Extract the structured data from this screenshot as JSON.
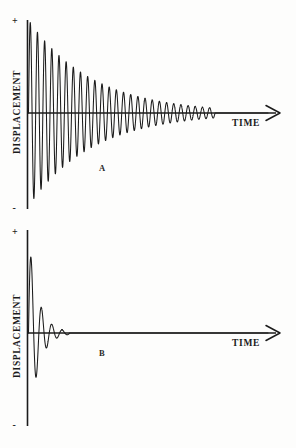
{
  "figure": {
    "title": "",
    "background_color": "#fdfdfc",
    "line_color": "#1b1b1b"
  },
  "panels": [
    {
      "id": "A",
      "letter_label": "A",
      "y_axis_label": "DISPLACEMENT",
      "x_axis_label": "TIME",
      "positive_sign": "+",
      "negative_sign": "-",
      "x_axis_arrow": "arrow-right-icon"
    },
    {
      "id": "B",
      "letter_label": "B",
      "y_axis_label": "DISPLACEMENT",
      "x_axis_label": "TIME",
      "positive_sign": "+",
      "negative_sign": "-",
      "x_axis_arrow": "arrow-right-icon"
    }
  ],
  "chart_data": [
    {
      "type": "line",
      "title": "A",
      "xlabel": "TIME",
      "ylabel": "DISPLACEMENT",
      "description": "Lightly damped free vibration: sinusoidal oscillation whose amplitude decays exponentially over many cycles.",
      "xlim": [
        0,
        1
      ],
      "ylim": [
        -1,
        1
      ],
      "grid": false,
      "legend": false,
      "yticks": [
        "+",
        "-"
      ],
      "series": [
        {
          "name": "displacement-a",
          "model": "damped-sine",
          "amplitude": 1.0,
          "damping_ratio": 0.0175,
          "cycles": 26,
          "decay_constant_per_cycle": 0.893,
          "x": [
            0.0,
            0.02,
            0.04,
            0.06,
            0.08,
            0.1,
            0.12,
            0.14,
            0.16,
            0.18,
            0.2,
            0.24,
            0.28,
            0.32,
            0.36,
            0.4,
            0.45,
            0.5,
            0.55,
            0.6,
            0.65,
            0.7,
            0.75,
            0.8,
            0.85,
            0.9,
            1.0
          ],
          "envelope": [
            1.0,
            0.93,
            0.86,
            0.8,
            0.74,
            0.69,
            0.64,
            0.59,
            0.55,
            0.51,
            0.47,
            0.41,
            0.35,
            0.3,
            0.26,
            0.22,
            0.18,
            0.14,
            0.11,
            0.09,
            0.07,
            0.05,
            0.04,
            0.03,
            0.02,
            0.015,
            0.0
          ]
        }
      ]
    },
    {
      "type": "line",
      "title": "B",
      "xlabel": "TIME",
      "ylabel": "DISPLACEMENT",
      "description": "Heavily damped free vibration: oscillation amplitude decays to zero within about three to four cycles.",
      "xlim": [
        0,
        1
      ],
      "ylim": [
        -1,
        1
      ],
      "grid": false,
      "legend": false,
      "yticks": [
        "+",
        "-"
      ],
      "series": [
        {
          "name": "displacement-b",
          "model": "damped-sine",
          "amplitude": 1.0,
          "damping_ratio": 0.17,
          "cycles": 4,
          "decay_constant_per_cycle": 0.34,
          "x": [
            0.0,
            0.01,
            0.02,
            0.03,
            0.04,
            0.05,
            0.06,
            0.07,
            0.08,
            0.09,
            0.1,
            0.12,
            0.15,
            0.2,
            0.3,
            0.5,
            1.0
          ],
          "envelope": [
            1.0,
            0.77,
            0.6,
            0.46,
            0.35,
            0.27,
            0.2,
            0.15,
            0.11,
            0.085,
            0.065,
            0.04,
            0.02,
            0.008,
            0.002,
            0.0,
            0.0
          ]
        }
      ]
    }
  ]
}
